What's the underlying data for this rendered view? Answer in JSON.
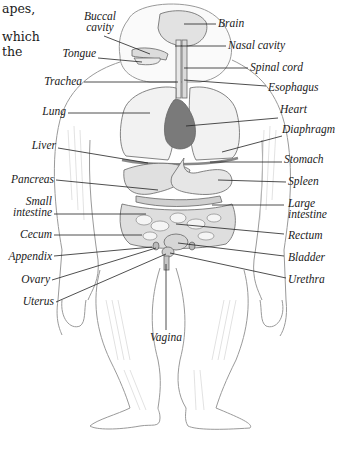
{
  "body_text_fragments": [
    "apes,",
    "which",
    "the"
  ],
  "diagram": {
    "labels_left": [
      {
        "id": "buccal-cavity",
        "text_lines": [
          "Buccal",
          "cavity"
        ]
      },
      {
        "id": "tongue",
        "text_lines": [
          "Tongue"
        ]
      },
      {
        "id": "trachea",
        "text_lines": [
          "Trachea"
        ]
      },
      {
        "id": "lung",
        "text_lines": [
          "Lung"
        ]
      },
      {
        "id": "liver",
        "text_lines": [
          "Liver"
        ]
      },
      {
        "id": "pancreas",
        "text_lines": [
          "Pancreas"
        ]
      },
      {
        "id": "small-intestine",
        "text_lines": [
          "Small",
          "intestine"
        ]
      },
      {
        "id": "cecum",
        "text_lines": [
          "Cecum"
        ]
      },
      {
        "id": "appendix",
        "text_lines": [
          "Appendix"
        ]
      },
      {
        "id": "ovary",
        "text_lines": [
          "Ovary"
        ]
      },
      {
        "id": "uterus",
        "text_lines": [
          "Uterus"
        ]
      }
    ],
    "labels_right": [
      {
        "id": "brain",
        "text_lines": [
          "Brain"
        ]
      },
      {
        "id": "nasal-cavity",
        "text_lines": [
          "Nasal cavity"
        ]
      },
      {
        "id": "spinal-cord",
        "text_lines": [
          "Spinal cord"
        ]
      },
      {
        "id": "esophagus",
        "text_lines": [
          "Esophagus"
        ]
      },
      {
        "id": "heart",
        "text_lines": [
          "Heart"
        ]
      },
      {
        "id": "diaphragm",
        "text_lines": [
          "Diaphragm"
        ]
      },
      {
        "id": "stomach",
        "text_lines": [
          "Stomach"
        ]
      },
      {
        "id": "spleen",
        "text_lines": [
          "Spleen"
        ]
      },
      {
        "id": "large-intestine",
        "text_lines": [
          "Large",
          "intestine"
        ]
      },
      {
        "id": "rectum",
        "text_lines": [
          "Rectum"
        ]
      },
      {
        "id": "bladder",
        "text_lines": [
          "Bladder"
        ]
      },
      {
        "id": "urethra",
        "text_lines": [
          "Urethra"
        ]
      }
    ],
    "labels_bottom": [
      {
        "id": "vagina",
        "text_lines": [
          "Vagina"
        ]
      }
    ],
    "colors": {
      "outline": "#555555",
      "fur": "#b8b8b8",
      "organ_light": "#e6e6e6",
      "organ_mid": "#c8c8c8",
      "heart": "#7a7a7a",
      "leader": "#222222"
    }
  }
}
